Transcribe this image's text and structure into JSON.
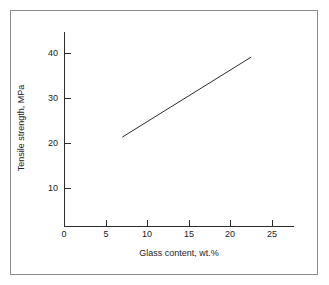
{
  "figure": {
    "background_color": "#ffffff",
    "frame_color": "#8d8d8d",
    "axis_color": "#2b2b2b",
    "text_color": "#1c1c1c"
  },
  "chart_data": {
    "type": "line",
    "title": "",
    "subtitle": "",
    "xlabel": "Glass content, wt.%",
    "ylabel": "Tensile strength, MPa",
    "xlim": [
      0,
      27.5
    ],
    "ylim": [
      0,
      44
    ],
    "xticks": [
      0,
      5,
      10,
      15,
      20,
      25
    ],
    "xtick_labels": [
      "0",
      "5",
      "10",
      "15",
      "20",
      "25"
    ],
    "yticks": [
      10,
      20,
      30,
      40
    ],
    "ytick_labels": [
      "10",
      "20",
      "30",
      "40"
    ],
    "grid": false,
    "legend": null,
    "legend_position": "none",
    "tick_direction": "in",
    "series": [
      {
        "name": "Tensile strength",
        "color": "#2b2b2b",
        "line_width": 1,
        "marker": "none",
        "x": [
          7.0,
          22.5
        ],
        "y": [
          21.3,
          39.1
        ]
      }
    ],
    "annotations": []
  }
}
